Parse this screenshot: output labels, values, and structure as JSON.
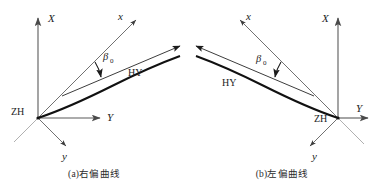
{
  "figure": {
    "type": "engineering-survey-spiral-curve-diagram",
    "panel_count": 2,
    "colors": {
      "curve": "#111111",
      "axis": "#5a5a5a",
      "tangent": "#6e6e6e",
      "text": "#1c1c1c",
      "background": "#ffffff"
    }
  },
  "panels": [
    {
      "id": "right-deflecting",
      "caption": "(a)右偏曲线",
      "labels": {
        "global_x_axis": "X",
        "global_y_axis": "Y",
        "local_x_axis": "x",
        "local_y_axis": "y",
        "origin_point": "ZH",
        "end_point": "HY",
        "angle": "β",
        "angle_subscript": "0"
      },
      "geometry": {
        "origin": [
          38,
          118
        ],
        "global_x_axis_end": [
          38,
          16
        ],
        "global_y_axis_end": [
          104,
          118
        ],
        "local_x_axis_end": [
          140,
          18
        ],
        "local_y_axis_end": [
          72,
          152
        ],
        "curve_start": [
          38,
          118
        ],
        "curve_control": [
          108,
          100
        ],
        "curve_end": [
          178,
          58
        ],
        "tangent_from": [
          66,
          88
        ],
        "tangent_to": [
          178,
          50
        ]
      }
    },
    {
      "id": "left-deflecting",
      "caption": "(b)左偏曲线",
      "labels": {
        "global_x_axis": "X",
        "global_y_axis": "Y",
        "local_x_axis": "x",
        "local_y_axis": "y",
        "origin_point": "ZH",
        "end_point": "HY",
        "angle": "β",
        "angle_subscript": "0"
      },
      "geometry": {
        "origin": [
          150,
          118
        ],
        "global_x_axis_end": [
          150,
          16
        ],
        "global_y_axis_end": [
          184,
          118
        ],
        "local_x_axis_end": [
          48,
          18
        ],
        "local_y_axis_end": [
          116,
          152
        ],
        "curve_start": [
          150,
          118
        ],
        "curve_control": [
          80,
          100
        ],
        "curve_end": [
          10,
          58
        ],
        "tangent_from": [
          122,
          88
        ],
        "tangent_to": [
          10,
          50
        ]
      }
    }
  ]
}
